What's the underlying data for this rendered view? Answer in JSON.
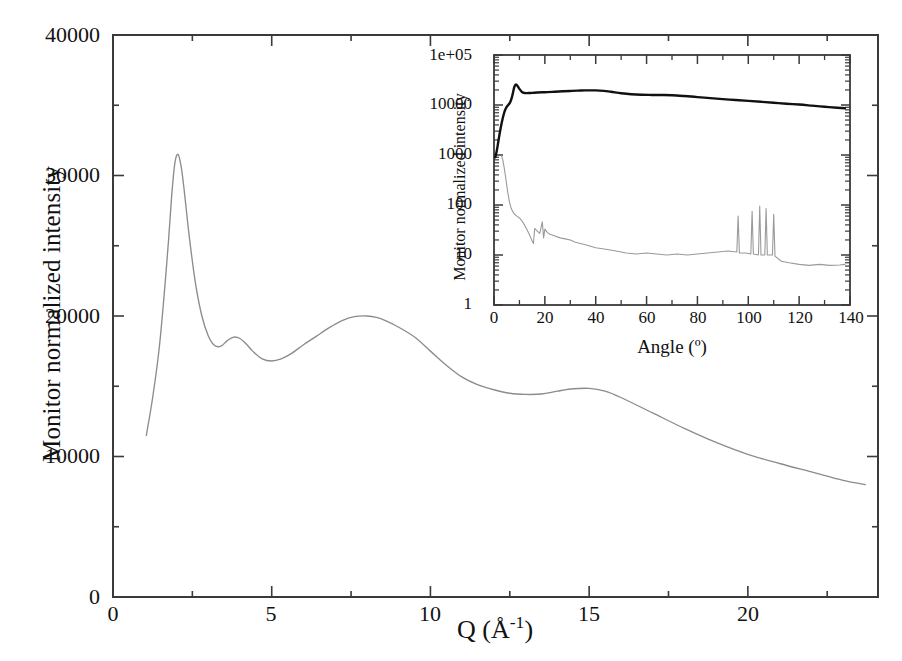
{
  "figure": {
    "background": "#ffffff",
    "axis_color": "#3a3a3a",
    "main_curve_color": "#8c8c8c",
    "inset_dark_curve_color": "#111111",
    "inset_light_curve_color": "#9a9a9a"
  },
  "main": {
    "ylabel": "Monitor normalized intensity",
    "xlabel_q": "Q (",
    "xlabel_unit": "Å",
    "xlabel_exp": "-1",
    "xlabel_close": ")",
    "y_ticks": [
      "0",
      "10000",
      "20000",
      "30000",
      "40000"
    ],
    "x_ticks": [
      "0",
      "5",
      "10",
      "15",
      "20"
    ]
  },
  "inset": {
    "ylabel": "Monitor normalized intensity",
    "xlabel": "Angle (º)",
    "y_ticks": [
      "1",
      "10",
      "100",
      "1000",
      "10000",
      "1e+05"
    ],
    "x_ticks": [
      "0",
      "20",
      "40",
      "60",
      "80",
      "100",
      "120",
      "140"
    ]
  },
  "chart_data": [
    {
      "type": "line",
      "name": "main-panel",
      "title": "",
      "xlabel": "Q (Å-1)",
      "ylabel": "Monitor normalized intensity",
      "xlim": [
        0,
        24.1
      ],
      "ylim": [
        0,
        40000
      ],
      "xticks": [
        0,
        5,
        10,
        15,
        20
      ],
      "yticks": [
        0,
        10000,
        20000,
        30000,
        40000
      ],
      "minor_xticks": [
        2.5,
        7.5,
        12.5,
        17.5,
        22.5
      ],
      "minor_yticks": [
        5000,
        15000,
        25000,
        35000
      ],
      "grid": false,
      "legend": false,
      "series": [
        {
          "name": "S(Q) total structure factor",
          "color": "#8c8c8c",
          "x": [
            1.05,
            1.25,
            1.45,
            1.6,
            1.75,
            1.85,
            1.95,
            2.05,
            2.15,
            2.25,
            2.4,
            2.6,
            2.8,
            3.0,
            3.2,
            3.4,
            3.6,
            3.8,
            4.0,
            4.2,
            4.4,
            4.7,
            5.0,
            5.3,
            5.6,
            6.0,
            6.4,
            6.8,
            7.2,
            7.6,
            8.0,
            8.3,
            8.6,
            9.0,
            9.5,
            10.0,
            10.5,
            11.0,
            11.5,
            12.0,
            12.5,
            13.0,
            13.5,
            14.0,
            14.5,
            15.0,
            15.5,
            16.0,
            17.0,
            18.0,
            19.0,
            20.0,
            21.0,
            22.0,
            23.0,
            23.7
          ],
          "y": [
            11500,
            14200,
            17600,
            21200,
            25400,
            28600,
            30900,
            31500,
            30600,
            28800,
            25700,
            22300,
            20000,
            18600,
            17900,
            17850,
            18250,
            18500,
            18400,
            18000,
            17500,
            16950,
            16800,
            16950,
            17300,
            17950,
            18550,
            19150,
            19650,
            19950,
            20000,
            19900,
            19650,
            19200,
            18500,
            17500,
            16500,
            15650,
            15100,
            14750,
            14500,
            14420,
            14450,
            14650,
            14820,
            14850,
            14650,
            14200,
            13100,
            12000,
            11000,
            10150,
            9500,
            8900,
            8300,
            8000
          ]
        }
      ]
    },
    {
      "type": "line",
      "name": "inset-panel",
      "title": "",
      "xlabel": "Angle (º)",
      "ylabel": "Monitor normalized intensity",
      "xlim": [
        0,
        140
      ],
      "ylim": [
        1,
        100000
      ],
      "yscale": "log",
      "xticks": [
        0,
        20,
        40,
        60,
        80,
        100,
        120,
        140
      ],
      "yticks": [
        1,
        10,
        100,
        1000,
        10000,
        100000
      ],
      "grid": false,
      "legend": false,
      "series": [
        {
          "name": "sample signal",
          "color": "#111111",
          "x": [
            0.5,
            1.0,
            1.5,
            2.0,
            2.5,
            3.0,
            3.5,
            4.0,
            4.5,
            5.0,
            5.5,
            6.0,
            6.5,
            7.0,
            7.5,
            8.0,
            8.5,
            9.0,
            9.5,
            10.0,
            11.0,
            12.0,
            13.0,
            14.0,
            15.0,
            17.0,
            19.0,
            21.0,
            24.0,
            27.0,
            30.0,
            33.0,
            36.0,
            38.0,
            40.0,
            43.0,
            46.0,
            50.0,
            54.0,
            58.0,
            62.0,
            66.0,
            70.0,
            75.0,
            80.0,
            85.0,
            90.0,
            95.0,
            100.0,
            105.0,
            110.0,
            115.0,
            120.0,
            125.0,
            130.0,
            135.0,
            138.0
          ],
          "y": [
            900,
            1150,
            1600,
            2300,
            3200,
            4300,
            5600,
            7000,
            8200,
            9200,
            9900,
            10600,
            11800,
            14000,
            18000,
            23000,
            25500,
            25000,
            23000,
            21000,
            18200,
            17400,
            17300,
            17400,
            17500,
            17800,
            18000,
            18100,
            18400,
            18800,
            19100,
            19400,
            19600,
            19650,
            19600,
            19200,
            18400,
            17200,
            16400,
            16000,
            15900,
            15850,
            15700,
            15100,
            14400,
            13700,
            13100,
            12600,
            12100,
            11600,
            11100,
            10600,
            10200,
            9700,
            9200,
            8800,
            8600
          ]
        },
        {
          "name": "empty container / background",
          "color": "#9a9a9a",
          "x": [
            3.0,
            3.5,
            4.0,
            4.5,
            5.0,
            5.5,
            6.0,
            6.5,
            7.0,
            7.5,
            8.0,
            9.0,
            10.0,
            11.0,
            12.0,
            13.0,
            14.0,
            15.0,
            15.5,
            16.0,
            17.0,
            18.0,
            19.0,
            19.5,
            20.0,
            21.0,
            22.0,
            24.0,
            26.0,
            28.0,
            30.0,
            32.0,
            34.0,
            36.0,
            38.0,
            40.0,
            44.0,
            48.0,
            52.0,
            56.0,
            60.0,
            64.0,
            68.0,
            72.0,
            76.0,
            80.0,
            84.0,
            88.0,
            92.0,
            95.5,
            96.0,
            96.5,
            99.0,
            101.0,
            101.5,
            102.0,
            104.0,
            104.5,
            105.0,
            106.5,
            107.0,
            107.5,
            109.5,
            110.0,
            110.5,
            113.0,
            116.0,
            120.0,
            124.0,
            128.0,
            132.0,
            136.0,
            138.0
          ],
          "y": [
            950,
            780,
            560,
            380,
            250,
            170,
            120,
            95,
            80,
            72,
            66,
            60,
            55,
            48,
            40,
            32,
            25,
            19,
            17,
            34,
            30,
            27,
            46,
            22,
            33,
            28,
            26,
            24,
            22,
            21,
            20,
            18,
            17,
            16,
            15,
            14,
            13,
            12,
            11,
            10.5,
            11,
            10.5,
            10,
            10.5,
            10,
            10.5,
            11,
            11.5,
            12,
            11.5,
            60,
            11,
            11,
            10.5,
            75,
            10.5,
            10,
            95,
            10,
            10,
            85,
            10,
            10,
            65,
            9.5,
            7.5,
            7,
            6.5,
            6.2,
            6.5,
            6.2,
            6.3,
            6.5
          ]
        }
      ]
    }
  ]
}
